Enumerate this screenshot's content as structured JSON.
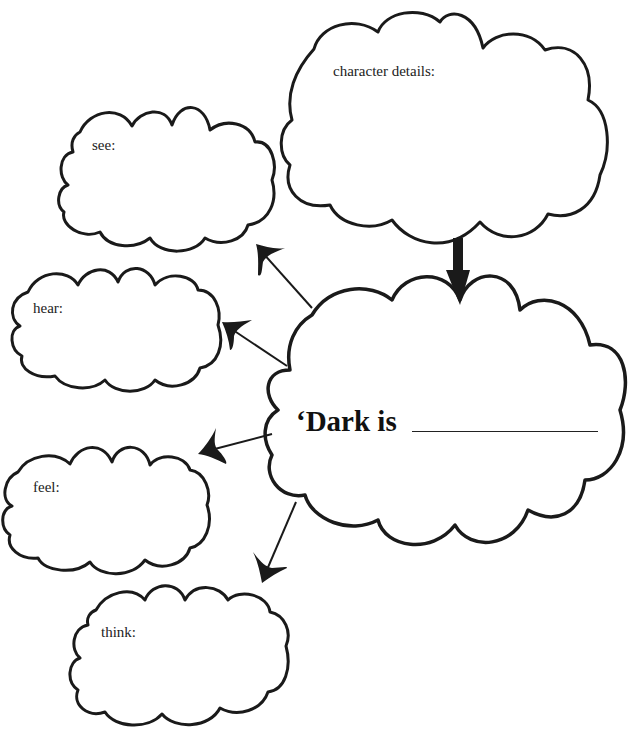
{
  "diagram": {
    "type": "cloud-web",
    "center": {
      "label": "‘Dark is",
      "blank": "________________"
    },
    "clouds": [
      {
        "id": "character",
        "label": "character details:"
      },
      {
        "id": "see",
        "label": "see:"
      },
      {
        "id": "hear",
        "label": "hear:"
      },
      {
        "id": "feel",
        "label": "feel:"
      },
      {
        "id": "think",
        "label": "think:"
      }
    ],
    "edges": [
      {
        "from": "character",
        "to": "center"
      },
      {
        "from": "center",
        "to": "see"
      },
      {
        "from": "center",
        "to": "hear"
      },
      {
        "from": "center",
        "to": "feel"
      },
      {
        "from": "center",
        "to": "think"
      }
    ]
  }
}
